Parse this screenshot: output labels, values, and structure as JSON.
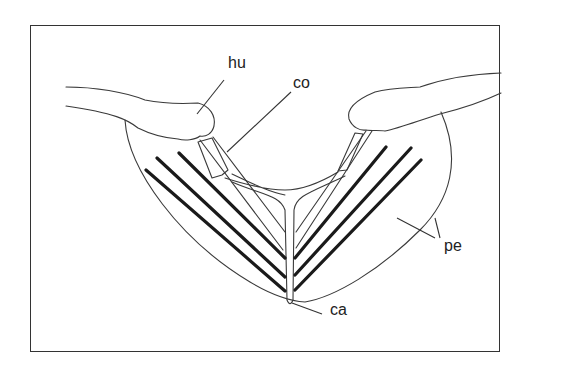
{
  "figure": {
    "type": "anatomical line drawing",
    "labels": [
      {
        "id": "hu",
        "text": "hu",
        "meaning_hint": "humerus"
      },
      {
        "id": "co",
        "text": "co",
        "meaning_hint": "coracoid"
      },
      {
        "id": "pe",
        "text": "pe",
        "meaning_hint": "pectoralis"
      },
      {
        "id": "ca",
        "text": "ca",
        "meaning_hint": "carina"
      }
    ],
    "colors": {
      "background": "#ffffff",
      "line": "#333333",
      "thick_line": "#1a1a1a"
    }
  }
}
